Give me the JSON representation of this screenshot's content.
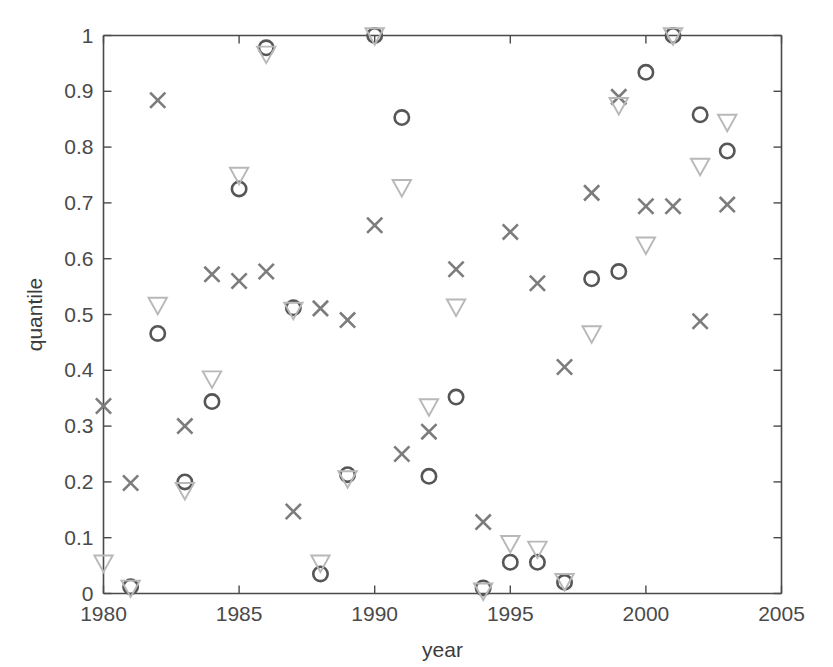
{
  "chart_data": {
    "type": "scatter",
    "title": "",
    "xlabel": "year",
    "ylabel": "quantile",
    "xlim": [
      1980,
      2005
    ],
    "ylim": [
      0,
      1
    ],
    "xticks": [
      1980,
      1985,
      1990,
      1995,
      2000,
      2005
    ],
    "xtick_labels": [
      "1980",
      "1985",
      "1990",
      "1995",
      "2000",
      "2005"
    ],
    "yticks": [
      0,
      0.1,
      0.2,
      0.3,
      0.4,
      0.5,
      0.6,
      0.7,
      0.8,
      0.9,
      1
    ],
    "ytick_labels": [
      "0",
      "0.1",
      "0.2",
      "0.3",
      "0.4",
      "0.5",
      "0.6",
      "0.7",
      "0.8",
      "0.9",
      "1"
    ],
    "grid": false,
    "legend": "none",
    "series": [
      {
        "name": "cross",
        "marker": "x",
        "color": "#7c7c7c",
        "x": [
          1980,
          1981,
          1982,
          1983,
          1984,
          1985,
          1986,
          1987,
          1988,
          1989,
          1990,
          1991,
          1992,
          1993,
          1994,
          1995,
          1996,
          1997,
          1998,
          1999,
          2000,
          2001,
          2002,
          2003
        ],
        "y": [
          0.336,
          0.198,
          0.884,
          0.3,
          0.572,
          0.56,
          0.577,
          0.147,
          0.511,
          0.49,
          0.66,
          0.25,
          0.29,
          0.581,
          0.128,
          0.648,
          0.556,
          0.406,
          0.718,
          0.89,
          0.694,
          0.694,
          0.488,
          0.697
        ]
      },
      {
        "name": "circle",
        "marker": "o",
        "color": "#565656",
        "x": [
          1981,
          1982,
          1983,
          1984,
          1985,
          1986,
          1987,
          1988,
          1989,
          1990,
          1991,
          1992,
          1993,
          1994,
          1995,
          1996,
          1997,
          1998,
          1999,
          2000,
          2001,
          2002,
          2003
        ],
        "y": [
          0.012,
          0.466,
          0.2,
          0.344,
          0.725,
          0.978,
          0.512,
          0.035,
          0.213,
          1.0,
          0.853,
          0.21,
          0.352,
          0.01,
          0.056,
          0.056,
          0.02,
          0.564,
          0.577,
          0.934,
          1.0,
          0.858,
          0.793
        ]
      },
      {
        "name": "triangle-down",
        "marker": "v",
        "color": "#b8b8b8",
        "x": [
          1980,
          1981,
          1982,
          1983,
          1984,
          1985,
          1986,
          1987,
          1988,
          1989,
          1990,
          1991,
          1992,
          1993,
          1994,
          1995,
          1996,
          1997,
          1998,
          1999,
          2000,
          2001,
          2002,
          2003
        ],
        "y": [
          0.055,
          0.01,
          0.517,
          0.185,
          0.385,
          0.75,
          0.967,
          0.508,
          0.055,
          0.206,
          1.0,
          0.728,
          0.335,
          0.514,
          0.005,
          0.09,
          0.08,
          0.022,
          0.466,
          0.875,
          0.625,
          1.0,
          0.766,
          0.845
        ]
      }
    ]
  },
  "axes": {
    "xlabel": "year",
    "ylabel": "quantile"
  }
}
